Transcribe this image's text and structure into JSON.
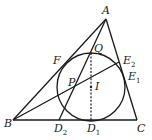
{
  "figure": {
    "colors": {
      "stroke": "#1a1a1a",
      "background": "#ffffff"
    },
    "points": {
      "A": {
        "label": "A",
        "sub": "",
        "x": 106,
        "y": 19
      },
      "B": {
        "label": "B",
        "sub": "",
        "x": 13,
        "y": 120
      },
      "C": {
        "label": "C",
        "sub": "",
        "x": 137,
        "y": 120
      },
      "D1": {
        "label": "D",
        "sub": "1",
        "x": 91,
        "y": 120
      },
      "D2": {
        "label": "D",
        "sub": "2",
        "x": 59,
        "y": 120
      },
      "E1": {
        "label": "E",
        "sub": "1",
        "x": 125,
        "y": 80
      },
      "E2": {
        "label": "E",
        "sub": "2",
        "x": 119,
        "y": 62
      },
      "F": {
        "label": "F",
        "sub": "",
        "x": 61,
        "y": 68
      },
      "P": {
        "label": "P",
        "sub": "",
        "x": 74,
        "y": 85
      },
      "Q": {
        "label": "Q",
        "sub": "",
        "x": 91,
        "y": 53
      },
      "I": {
        "label": "I",
        "sub": "",
        "x": 91,
        "y": 87
      }
    },
    "labels": {
      "A": "A",
      "B": "B",
      "C": "C",
      "D1_main": "D",
      "D1_sub": "1",
      "D2_main": "D",
      "D2_sub": "2",
      "E1_main": "E",
      "E1_sub": "1",
      "E2_main": "E",
      "E2_sub": "2",
      "F": "F",
      "P": "P",
      "Q": "Q",
      "I": "I"
    },
    "incircle": {
      "center": "I",
      "cx": 91,
      "cy": 87,
      "r": 34
    },
    "segments": [
      {
        "from": "A",
        "to": "B",
        "style": "solid"
      },
      {
        "from": "B",
        "to": "C",
        "style": "solid"
      },
      {
        "from": "C",
        "to": "A",
        "style": "solid"
      },
      {
        "from": "B",
        "to": "E2",
        "style": "solid"
      },
      {
        "from": "A",
        "to": "D2",
        "style": "solid"
      },
      {
        "from": "Q",
        "to": "D1",
        "style": "dashed"
      }
    ]
  }
}
